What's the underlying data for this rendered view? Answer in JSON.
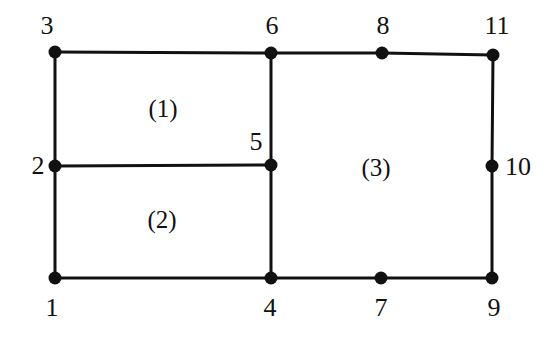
{
  "figure": {
    "background_color": "#ffffff",
    "line_color": "#111111",
    "node_color": "#111111",
    "text_color": "#111111",
    "line_width": 3,
    "node_radius": 6.5,
    "width": 555,
    "height": 342
  },
  "nodes": [
    {
      "id": "1",
      "label": "1",
      "x": 55,
      "y": 278,
      "label_x": 52,
      "label_y": 308
    },
    {
      "id": "2",
      "label": "2",
      "x": 55,
      "y": 166,
      "label_x": 38,
      "label_y": 166
    },
    {
      "id": "3",
      "label": "3",
      "x": 55,
      "y": 52,
      "label_x": 47,
      "label_y": 26
    },
    {
      "id": "4",
      "label": "4",
      "x": 271,
      "y": 278,
      "label_x": 270,
      "label_y": 308
    },
    {
      "id": "5",
      "label": "5",
      "x": 271,
      "y": 165,
      "label_x": 256,
      "label_y": 142
    },
    {
      "id": "6",
      "label": "6",
      "x": 271,
      "y": 53,
      "label_x": 272,
      "label_y": 26
    },
    {
      "id": "7",
      "label": "7",
      "x": 381,
      "y": 278,
      "label_x": 381,
      "label_y": 308
    },
    {
      "id": "8",
      "label": "8",
      "x": 382,
      "y": 53,
      "label_x": 383,
      "label_y": 26
    },
    {
      "id": "9",
      "label": "9",
      "x": 492,
      "y": 278,
      "label_x": 494,
      "label_y": 308
    },
    {
      "id": "10",
      "label": "10",
      "x": 492,
      "y": 166,
      "label_x": 518,
      "label_y": 167
    },
    {
      "id": "11",
      "label": "11",
      "x": 493,
      "y": 55,
      "label_x": 497,
      "label_y": 26
    }
  ],
  "edges": [
    {
      "from": "3",
      "to": "6",
      "x1": 55,
      "y1": 52,
      "x2": 271,
      "y2": 53
    },
    {
      "from": "6",
      "to": "8",
      "x1": 271,
      "y1": 53,
      "x2": 382,
      "y2": 53
    },
    {
      "from": "8",
      "to": "11",
      "x1": 382,
      "y1": 53,
      "x2": 493,
      "y2": 55
    },
    {
      "from": "3",
      "to": "2",
      "x1": 55,
      "y1": 52,
      "x2": 55,
      "y2": 166
    },
    {
      "from": "2",
      "to": "1",
      "x1": 55,
      "y1": 166,
      "x2": 55,
      "y2": 278
    },
    {
      "from": "2",
      "to": "5",
      "x1": 55,
      "y1": 166,
      "x2": 271,
      "y2": 165
    },
    {
      "from": "6",
      "to": "5",
      "x1": 271,
      "y1": 53,
      "x2": 271,
      "y2": 165
    },
    {
      "from": "5",
      "to": "4",
      "x1": 271,
      "y1": 165,
      "x2": 271,
      "y2": 278
    },
    {
      "from": "1",
      "to": "4",
      "x1": 55,
      "y1": 278,
      "x2": 271,
      "y2": 278
    },
    {
      "from": "4",
      "to": "7",
      "x1": 271,
      "y1": 278,
      "x2": 381,
      "y2": 278
    },
    {
      "from": "7",
      "to": "9",
      "x1": 381,
      "y1": 278,
      "x2": 492,
      "y2": 278
    },
    {
      "from": "11",
      "to": "10",
      "x1": 493,
      "y1": 55,
      "x2": 492,
      "y2": 166
    },
    {
      "from": "10",
      "to": "9",
      "x1": 492,
      "y1": 166,
      "x2": 492,
      "y2": 278
    }
  ],
  "regions": [
    {
      "id": "1",
      "label": "(1)",
      "x": 163,
      "y": 108
    },
    {
      "id": "2",
      "label": "(2)",
      "x": 162,
      "y": 219
    },
    {
      "id": "3",
      "label": "(3)",
      "x": 376,
      "y": 167
    }
  ]
}
